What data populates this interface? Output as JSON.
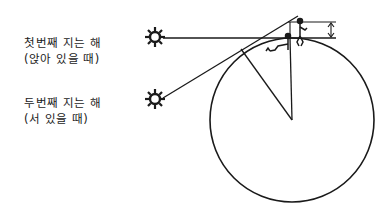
{
  "labels": {
    "first_sunset": {
      "line1": "첫번째 지는 해",
      "line2": "(앉아 있을 때)"
    },
    "second_sunset": {
      "line1": "두번째 지는 해",
      "line2": "(서 있을 때)"
    }
  },
  "icons": {
    "sun_first": "sun-icon",
    "sun_second": "sun-icon",
    "person_sitting": "sitting-person-icon",
    "person_standing": "standing-person-icon",
    "height_arrow": "double-arrow-icon"
  },
  "colors": {
    "stroke": "#1a1a1a",
    "background": "#ffffff"
  }
}
